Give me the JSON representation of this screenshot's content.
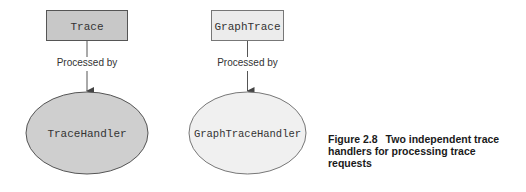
{
  "diagram": {
    "left": {
      "source": {
        "label": "Trace",
        "fill": "#c8c8c8"
      },
      "edge_label": "Processed by",
      "target": {
        "label": "TraceHandler",
        "fill": "#cfcfcf"
      }
    },
    "right": {
      "source": {
        "label": "GraphTrace",
        "fill": "#ececec"
      },
      "edge_label": "Processed by",
      "target": {
        "label": "GraphTraceHandler",
        "fill": "#f0f0f0"
      }
    }
  },
  "caption": {
    "number": "Figure 2.8",
    "text": "Two independent trace handlers for processing trace requests"
  }
}
